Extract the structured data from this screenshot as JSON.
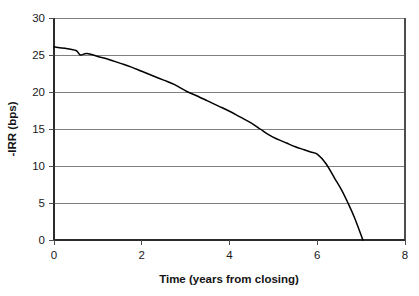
{
  "chart_data": {
    "type": "line",
    "title": "",
    "xlabel": "Time (years from closing)",
    "ylabel": "-IRR (bps)",
    "xlim": [
      0,
      8
    ],
    "ylim": [
      0,
      30
    ],
    "xticks": [
      "0",
      "2",
      "4",
      "6",
      "8"
    ],
    "xtick_values": [
      0,
      2,
      4,
      6,
      8
    ],
    "yticks": [
      "0",
      "5",
      "10",
      "15",
      "20",
      "25",
      "30"
    ],
    "ytick_values": [
      0,
      5,
      10,
      15,
      20,
      25,
      30
    ],
    "grid": "horizontal",
    "legend": "none",
    "series": [
      {
        "name": "-IRR",
        "x": [
          0.0,
          0.25,
          0.5,
          0.6,
          0.75,
          1.0,
          1.25,
          1.5,
          1.75,
          2.0,
          2.25,
          2.5,
          2.75,
          3.05,
          3.25,
          3.5,
          3.75,
          4.0,
          4.25,
          4.5,
          4.7,
          4.9,
          5.1,
          5.3,
          5.5,
          5.7,
          5.85,
          6.0,
          6.2,
          6.4,
          6.55,
          6.7,
          6.85,
          7.04
        ],
        "y": [
          26.1,
          25.9,
          25.6,
          25.0,
          25.2,
          24.8,
          24.4,
          23.9,
          23.4,
          22.8,
          22.2,
          21.6,
          21.0,
          20.0,
          19.5,
          18.8,
          18.1,
          17.4,
          16.6,
          15.8,
          15.0,
          14.2,
          13.6,
          13.1,
          12.6,
          12.2,
          11.9,
          11.6,
          10.3,
          8.3,
          6.8,
          5.0,
          3.0,
          0.0
        ]
      }
    ]
  },
  "axis": {
    "x_title": "Time (years from closing)",
    "y_title": "-IRR (bps)",
    "x_tick_labels": [
      "0",
      "2",
      "4",
      "6",
      "8"
    ],
    "y_tick_labels": [
      "30",
      "25",
      "20",
      "15",
      "10",
      "5",
      "0"
    ]
  },
  "colors": {
    "curve": "#000000",
    "gridline": "#808080",
    "axis": "#4d4d4d",
    "background": "#ffffff",
    "text": "#1a1a1a"
  }
}
